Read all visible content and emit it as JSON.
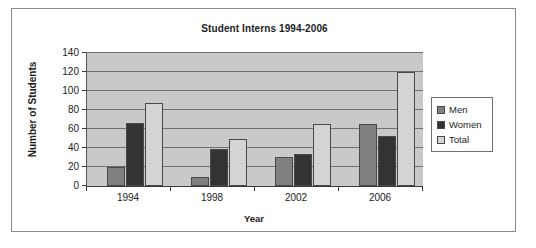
{
  "chart_data": {
    "type": "bar",
    "title": "Student Interns 1994-2006",
    "xlabel": "Year",
    "ylabel": "Number of Students",
    "categories": [
      "1994",
      "1998",
      "2002",
      "2006"
    ],
    "series": [
      {
        "name": "Men",
        "color": "#808080",
        "values": [
          20,
          10,
          31,
          65
        ]
      },
      {
        "name": "Women",
        "color": "#333333",
        "values": [
          66,
          39,
          34,
          53
        ]
      },
      {
        "name": "Total",
        "color": "#d4d4d4",
        "values": [
          87,
          50,
          65,
          120
        ]
      }
    ],
    "ylim": [
      0,
      140
    ],
    "ytick_values": [
      0,
      20,
      40,
      60,
      80,
      100,
      120,
      140
    ],
    "ytick_labels": [
      "0",
      "20",
      "40",
      "60",
      "80",
      "100",
      "120",
      "140"
    ],
    "grid": true,
    "legend_position": "right",
    "plot_background": "#c9c9c9"
  }
}
